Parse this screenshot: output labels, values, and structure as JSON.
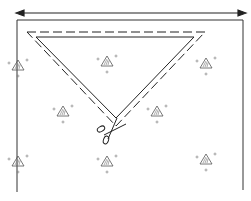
{
  "diagram": {
    "elements": {
      "width_arrow": "double-headed width arrow",
      "fabric": "printed fabric panel",
      "cut_triangle": "triangle pattern piece with dashed seam line",
      "scissors": "scissors cutting icon",
      "motif": "hatched triangle print motif"
    },
    "colors": {
      "ink": "#222222",
      "paper": "#ffffff",
      "motif": "#666666"
    },
    "motifs": [
      {
        "x": 17,
        "y": 68,
        "partial": true
      },
      {
        "x": 108,
        "y": 62
      },
      {
        "x": 206,
        "y": 65
      },
      {
        "x": 64,
        "y": 114
      },
      {
        "x": 158,
        "y": 114
      },
      {
        "x": 17,
        "y": 163,
        "partial": true
      },
      {
        "x": 108,
        "y": 163
      },
      {
        "x": 207,
        "y": 160
      }
    ]
  }
}
